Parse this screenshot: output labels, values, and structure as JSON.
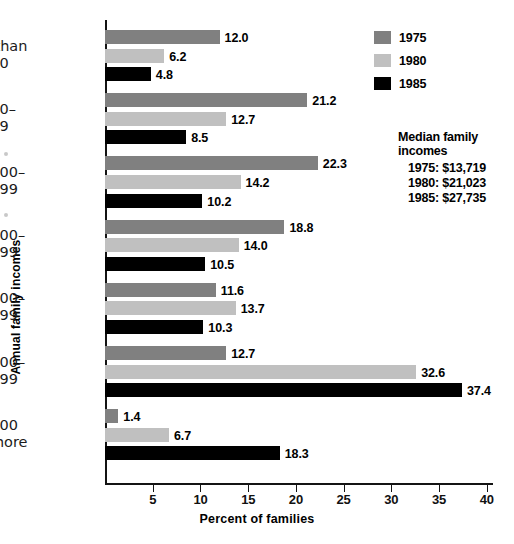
{
  "chart_data": {
    "type": "bar",
    "orientation": "horizontal",
    "title": "",
    "xlabel": "Percent of families",
    "ylabel": "Annual family incomes",
    "xlim": [
      0,
      42
    ],
    "xticks": [
      5,
      10,
      15,
      20,
      25,
      30,
      35,
      40
    ],
    "grid": false,
    "legend_position": "top-right",
    "categories": [
      "Less than\n$5,000",
      "$5,000–\n$9,999",
      "$10,000–\n$14,999",
      "$15,000–\n$19,999",
      "$20,000–\n$24,999",
      "$25,000–\n$49,999",
      "$50,000\nand more"
    ],
    "series": [
      {
        "name": "1975",
        "color": "#808080",
        "values": [
          12.0,
          21.2,
          22.3,
          18.8,
          11.6,
          12.7,
          1.4
        ]
      },
      {
        "name": "1980",
        "color": "#c0c0c0",
        "values": [
          6.2,
          12.7,
          14.2,
          14.0,
          13.7,
          32.6,
          6.7
        ]
      },
      {
        "name": "1985",
        "color": "#000000",
        "values": [
          4.8,
          8.5,
          10.2,
          10.5,
          10.3,
          37.4,
          18.3
        ]
      }
    ],
    "annotation": {
      "title": "Median family incomes",
      "rows": [
        "1975: $13,719",
        "1980: $21,023",
        "1985: $27,735"
      ]
    }
  },
  "categories_display": [
    {
      "line1": "Less than",
      "line2": "$5,000"
    },
    {
      "line1": "$5,000–",
      "line2": "$9,999"
    },
    {
      "line1": "$10,000–",
      "line2": "$14,999"
    },
    {
      "line1": "$15,000–",
      "line2": "$19,999"
    },
    {
      "line1": "$20,000–",
      "line2": "$24,999"
    },
    {
      "line1": "$25,000–",
      "line2": "$49,999"
    },
    {
      "line1": "$50,000",
      "line2": "and more"
    }
  ],
  "value_labels": [
    [
      "12.0",
      "6.2",
      "4.8"
    ],
    [
      "21.2",
      "12.7",
      "8.5"
    ],
    [
      "22.3",
      "14.2",
      "10.2"
    ],
    [
      "18.8",
      "14.0",
      "10.5"
    ],
    [
      "11.6",
      "13.7",
      "10.3"
    ],
    [
      "12.7",
      "32.6",
      "37.4"
    ],
    [
      "1.4",
      "6.7",
      "18.3"
    ]
  ],
  "tick_labels": [
    "5",
    "10",
    "15",
    "20",
    "25",
    "30",
    "35",
    "40"
  ],
  "axis": {
    "x_title": "Percent of families",
    "y_title": "Annual family incomes"
  },
  "legend": {
    "items": [
      {
        "label": "1975",
        "color": "#808080"
      },
      {
        "label": "1980",
        "color": "#c0c0c0"
      },
      {
        "label": "1985",
        "color": "#000000"
      }
    ]
  },
  "median": {
    "title": "Median family incomes",
    "rows": [
      "1975: $13,719",
      "1980: $21,023",
      "1985: $27,735"
    ]
  }
}
